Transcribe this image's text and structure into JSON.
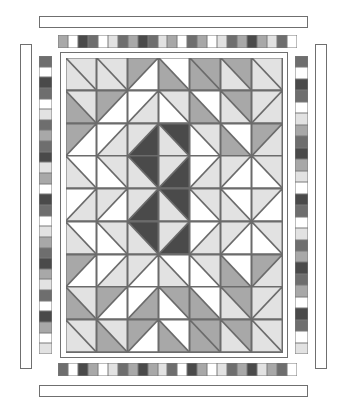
{
  "artwork": {
    "title": "Medallion Diamond Quilt Block Diagram",
    "type": "quilt-pattern-diagram",
    "background_color": "#ffffff",
    "outline_color": "#6f6f6f"
  },
  "palette": {
    "white": "#ffffff",
    "light": "#e2e2e2",
    "light2": "#d4d4d4",
    "mid": "#a8a8a8",
    "mid2": "#9a9a9a",
    "dark": "#6e6e6e",
    "darkest": "#4a4a4a",
    "line": "#6b6b6b"
  },
  "quilt": {
    "columns": 7,
    "rows": 9,
    "note": "Each cell is a half-square triangle unit. 'a' = upper/first triangle color, 'b' = lower/second triangle color, 'dir' = diagonal direction (tlbr = top-left to bottom-right, trbl = top-right to bottom-left), 'solid' = single color square.",
    "cells": [
      [
        {
          "type": "hst",
          "dir": "tlbr",
          "a": "light",
          "b": "light"
        },
        {
          "type": "hst",
          "dir": "tlbr",
          "a": "light",
          "b": "light"
        },
        {
          "type": "hst",
          "dir": "trbl",
          "a": "mid",
          "b": "white"
        },
        {
          "type": "hst",
          "dir": "tlbr",
          "a": "white",
          "b": "mid"
        },
        {
          "type": "hst",
          "dir": "tlbr",
          "a": "mid",
          "b": "mid"
        },
        {
          "type": "hst",
          "dir": "tlbr",
          "a": "mid",
          "b": "light"
        },
        {
          "type": "hst",
          "dir": "tlbr",
          "a": "light",
          "b": "light"
        }
      ],
      [
        {
          "type": "hst",
          "dir": "tlbr",
          "a": "light",
          "b": "mid"
        },
        {
          "type": "hst",
          "dir": "trbl",
          "a": "mid",
          "b": "white"
        },
        {
          "type": "hst",
          "dir": "trbl",
          "a": "white",
          "b": "light"
        },
        {
          "type": "hst",
          "dir": "tlbr",
          "a": "light",
          "b": "white"
        },
        {
          "type": "hst",
          "dir": "tlbr",
          "a": "white",
          "b": "mid"
        },
        {
          "type": "hst",
          "dir": "tlbr",
          "a": "mid",
          "b": "light"
        },
        {
          "type": "hst",
          "dir": "trbl",
          "a": "light",
          "b": "light"
        }
      ],
      [
        {
          "type": "hst",
          "dir": "trbl",
          "a": "mid",
          "b": "white"
        },
        {
          "type": "hst",
          "dir": "trbl",
          "a": "white",
          "b": "light"
        },
        {
          "type": "hst",
          "dir": "trbl",
          "a": "light",
          "b": "darkest"
        },
        {
          "type": "hst",
          "dir": "tlbr",
          "a": "darkest",
          "b": "light"
        },
        {
          "type": "hst",
          "dir": "tlbr",
          "a": "light",
          "b": "white"
        },
        {
          "type": "hst",
          "dir": "tlbr",
          "a": "white",
          "b": "mid"
        },
        {
          "type": "hst",
          "dir": "trbl",
          "a": "mid",
          "b": "light"
        }
      ],
      [
        {
          "type": "hst",
          "dir": "tlbr",
          "a": "white",
          "b": "light"
        },
        {
          "type": "hst",
          "dir": "tlbr",
          "a": "light",
          "b": "white"
        },
        {
          "type": "hst",
          "dir": "tlbr",
          "a": "darkest",
          "b": "light"
        },
        {
          "type": "hst",
          "dir": "trbl",
          "a": "light",
          "b": "darkest"
        },
        {
          "type": "hst",
          "dir": "trbl",
          "a": "white",
          "b": "light"
        },
        {
          "type": "hst",
          "dir": "trbl",
          "a": "light",
          "b": "white"
        },
        {
          "type": "hst",
          "dir": "tlbr",
          "a": "light",
          "b": "white"
        }
      ],
      [
        {
          "type": "hst",
          "dir": "trbl",
          "a": "white",
          "b": "light"
        },
        {
          "type": "hst",
          "dir": "trbl",
          "a": "light",
          "b": "white"
        },
        {
          "type": "hst",
          "dir": "trbl",
          "a": "light",
          "b": "darkest"
        },
        {
          "type": "hst",
          "dir": "tlbr",
          "a": "darkest",
          "b": "light"
        },
        {
          "type": "hst",
          "dir": "tlbr",
          "a": "light",
          "b": "white"
        },
        {
          "type": "hst",
          "dir": "tlbr",
          "a": "white",
          "b": "light"
        },
        {
          "type": "hst",
          "dir": "trbl",
          "a": "light",
          "b": "white"
        }
      ],
      [
        {
          "type": "hst",
          "dir": "tlbr",
          "a": "white",
          "b": "light"
        },
        {
          "type": "hst",
          "dir": "tlbr",
          "a": "light",
          "b": "white"
        },
        {
          "type": "hst",
          "dir": "tlbr",
          "a": "darkest",
          "b": "light"
        },
        {
          "type": "hst",
          "dir": "trbl",
          "a": "light",
          "b": "darkest"
        },
        {
          "type": "hst",
          "dir": "trbl",
          "a": "white",
          "b": "light"
        },
        {
          "type": "hst",
          "dir": "trbl",
          "a": "light",
          "b": "white"
        },
        {
          "type": "hst",
          "dir": "tlbr",
          "a": "light",
          "b": "white"
        }
      ],
      [
        {
          "type": "hst",
          "dir": "trbl",
          "a": "mid",
          "b": "white"
        },
        {
          "type": "hst",
          "dir": "trbl",
          "a": "white",
          "b": "light"
        },
        {
          "type": "hst",
          "dir": "trbl",
          "a": "light",
          "b": "white"
        },
        {
          "type": "hst",
          "dir": "tlbr",
          "a": "white",
          "b": "light"
        },
        {
          "type": "hst",
          "dir": "tlbr",
          "a": "light",
          "b": "white"
        },
        {
          "type": "hst",
          "dir": "tlbr",
          "a": "white",
          "b": "mid"
        },
        {
          "type": "hst",
          "dir": "trbl",
          "a": "mid",
          "b": "light"
        }
      ],
      [
        {
          "type": "hst",
          "dir": "tlbr",
          "a": "light",
          "b": "mid"
        },
        {
          "type": "hst",
          "dir": "trbl",
          "a": "mid",
          "b": "white"
        },
        {
          "type": "hst",
          "dir": "trbl",
          "a": "white",
          "b": "mid"
        },
        {
          "type": "hst",
          "dir": "tlbr",
          "a": "mid",
          "b": "white"
        },
        {
          "type": "hst",
          "dir": "tlbr",
          "a": "white",
          "b": "mid"
        },
        {
          "type": "hst",
          "dir": "tlbr",
          "a": "mid",
          "b": "light"
        },
        {
          "type": "hst",
          "dir": "trbl",
          "a": "light",
          "b": "light"
        }
      ],
      [
        {
          "type": "hst",
          "dir": "tlbr",
          "a": "light",
          "b": "light"
        },
        {
          "type": "hst",
          "dir": "tlbr",
          "a": "light",
          "b": "mid"
        },
        {
          "type": "hst",
          "dir": "trbl",
          "a": "mid",
          "b": "white"
        },
        {
          "type": "hst",
          "dir": "tlbr",
          "a": "white",
          "b": "mid"
        },
        {
          "type": "hst",
          "dir": "tlbr",
          "a": "mid",
          "b": "mid"
        },
        {
          "type": "hst",
          "dir": "tlbr",
          "a": "mid",
          "b": "light"
        },
        {
          "type": "hst",
          "dir": "tlbr",
          "a": "light",
          "b": "light"
        }
      ]
    ]
  },
  "borders": {
    "top_plain_outer": {
      "label": "top-outer-plain-border"
    },
    "bottom_plain_outer": {
      "label": "bottom-outer-plain-border"
    },
    "left_plain_outer": {
      "label": "left-outer-plain-border"
    },
    "right_plain_outer": {
      "label": "right-outer-plain-border"
    },
    "inner_plain_frame": {
      "label": "inner-plain-frame"
    },
    "top_checker": {
      "label": "top-checkered-border",
      "squares": [
        "mid",
        "white",
        "darkest",
        "dark",
        "white",
        "light",
        "dark",
        "mid",
        "darkest",
        "dark",
        "light",
        "mid",
        "white",
        "dark",
        "mid",
        "white",
        "light",
        "dark",
        "mid",
        "darkest",
        "mid",
        "light",
        "dark",
        "white"
      ]
    },
    "bottom_checker": {
      "label": "bottom-checkered-border",
      "squares": [
        "dark",
        "white",
        "darkest",
        "mid",
        "white",
        "light",
        "dark",
        "mid",
        "darkest",
        "mid",
        "light",
        "dark",
        "white",
        "darkest",
        "mid",
        "white",
        "light",
        "dark",
        "mid",
        "darkest",
        "light",
        "mid",
        "dark",
        "white"
      ]
    },
    "left_checker": {
      "label": "left-checkered-border",
      "squares": [
        "dark",
        "white",
        "darkest",
        "dark",
        "white",
        "light",
        "dark",
        "mid",
        "dark",
        "darkest",
        "light",
        "mid",
        "white",
        "darkest",
        "dark",
        "white",
        "light",
        "mid",
        "dark",
        "darkest",
        "mid",
        "light",
        "dark",
        "white",
        "darkest",
        "mid",
        "white",
        "light"
      ]
    },
    "right_checker": {
      "label": "right-checkered-border",
      "squares": [
        "dark",
        "white",
        "darkest",
        "dark",
        "white",
        "light",
        "mid",
        "dark",
        "darkest",
        "mid",
        "light",
        "white",
        "darkest",
        "dark",
        "white",
        "light",
        "dark",
        "mid",
        "darkest",
        "dark",
        "mid",
        "white",
        "darkest",
        "dark",
        "white",
        "light"
      ]
    }
  }
}
